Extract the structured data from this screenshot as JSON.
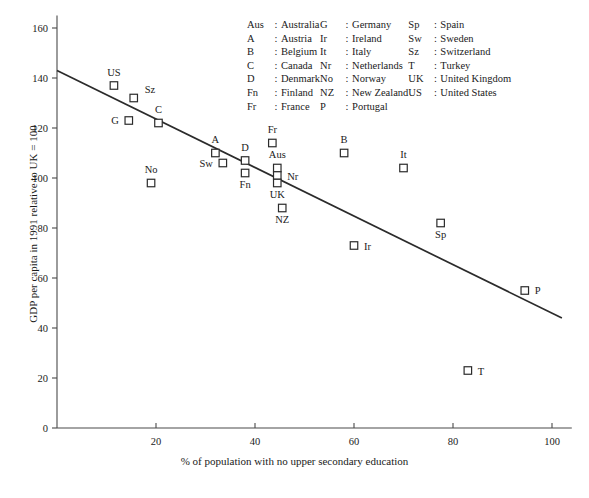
{
  "chart_data": {
    "type": "scatter",
    "title": "",
    "xlabel": "% of population with no upper secondary education",
    "ylabel": "GDP per capita in 1991 relative to UK = 100",
    "xlim": [
      0,
      104
    ],
    "ylim": [
      0,
      165
    ],
    "xticks": [
      0,
      20,
      40,
      60,
      80,
      100
    ],
    "yticks": [
      0,
      20,
      40,
      60,
      80,
      100,
      120,
      140,
      160
    ],
    "grid": false,
    "legend_position": "top-center",
    "points": [
      {
        "label": "US",
        "x": 11.5,
        "y": 137
      },
      {
        "label": "Sz",
        "x": 15.5,
        "y": 132
      },
      {
        "label": "G",
        "x": 14.5,
        "y": 123
      },
      {
        "label": "C",
        "x": 20.5,
        "y": 122
      },
      {
        "label": "No",
        "x": 19.0,
        "y": 98
      },
      {
        "label": "A",
        "x": 32.0,
        "y": 110
      },
      {
        "label": "Sw",
        "x": 33.5,
        "y": 106
      },
      {
        "label": "D",
        "x": 38.0,
        "y": 107
      },
      {
        "label": "Fn",
        "x": 38.0,
        "y": 102
      },
      {
        "label": "Fr",
        "x": 43.5,
        "y": 114
      },
      {
        "label": "Aus",
        "x": 44.5,
        "y": 104
      },
      {
        "label": "Nr",
        "x": 44.5,
        "y": 101
      },
      {
        "label": "UK",
        "x": 44.5,
        "y": 98
      },
      {
        "label": "NZ",
        "x": 45.5,
        "y": 88
      },
      {
        "label": "B",
        "x": 58.0,
        "y": 110
      },
      {
        "label": "Ir",
        "x": 60.0,
        "y": 73
      },
      {
        "label": "It",
        "x": 70.0,
        "y": 104
      },
      {
        "label": "Sp",
        "x": 77.5,
        "y": 82
      },
      {
        "label": "T",
        "x": 83.0,
        "y": 23
      },
      {
        "label": "P",
        "x": 94.5,
        "y": 55
      }
    ],
    "trend_line": {
      "x_start": 0,
      "y_start": 143,
      "x_end": 102,
      "y_end": 44
    }
  },
  "legend": {
    "rows": [
      {
        "a1": "Aus",
        "n1": "Australia",
        "a2": "G",
        "n2": "Germany",
        "a3": "Sp",
        "n3": "Spain"
      },
      {
        "a1": "A",
        "n1": "Austria",
        "a2": "Ir",
        "n2": "Ireland",
        "a3": "Sw",
        "n3": "Sweden"
      },
      {
        "a1": "B",
        "n1": "Belgium",
        "a2": "It",
        "n2": "Italy",
        "a3": "Sz",
        "n3": "Switzerland"
      },
      {
        "a1": "C",
        "n1": "Canada",
        "a2": "Nr",
        "n2": "Netherlands",
        "a3": "T",
        "n3": "Turkey"
      },
      {
        "a1": "D",
        "n1": "Denmark",
        "a2": "No",
        "n2": "Norway",
        "a3": "UK",
        "n3": "United Kingdom"
      },
      {
        "a1": "Fn",
        "n1": "Finland",
        "a2": "NZ",
        "n2": "New Zealand",
        "a3": "US",
        "n3": "United States"
      },
      {
        "a1": "Fr",
        "n1": "France",
        "a2": "P",
        "n2": "Portugal",
        "a3": "",
        "n3": ""
      }
    ],
    "separator": ":"
  },
  "colors": {
    "axis": "#4a4a4a",
    "marker_stroke": "#2b2b2b",
    "trend": "#2b2b2b",
    "text": "#1a1a1a",
    "background": "#ffffff"
  }
}
